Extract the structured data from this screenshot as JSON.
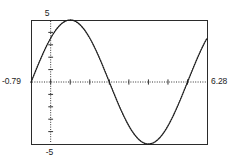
{
  "figure": {
    "name": "graphing-calculator-sine-plot",
    "background_color": "#ffffff",
    "ink_color": "#1c1c1c",
    "frame": {
      "left_px": 31,
      "top_px": 20,
      "right_px": 207,
      "bottom_px": 144,
      "border_color": "#2b2b2b",
      "border_width_px": 1
    }
  },
  "labels": {
    "y_max": "5",
    "y_min": "-5",
    "x_min": "-0.79",
    "x_max": "6.28"
  },
  "chart_data": {
    "type": "line",
    "title": "",
    "subtitle": "",
    "xlabel": "",
    "ylabel": "",
    "xlim": [
      -0.79,
      6.28
    ],
    "ylim": [
      -5,
      5
    ],
    "xtick_labels": [
      "-0.79",
      "6.28"
    ],
    "ytick_labels": [
      "5",
      "-5"
    ],
    "grid": false,
    "legend": null,
    "legend_position": "none",
    "axes_style": "dotted-with-ticks",
    "x_axis_y_value": 0,
    "y_axis_x_value": 0,
    "x_tick_interval": 0.7854,
    "y_tick_interval": 1,
    "annotations": [],
    "series": [
      {
        "name": "y = 5 sin(x + 0.79)",
        "amplitude": 5,
        "period": 6.2832,
        "phase_shift": 0.7854,
        "vertical_shift": 0,
        "line_style": "dotted",
        "line_color": "#1c1c1c",
        "x": [
          -0.79,
          -0.55,
          -0.31,
          -0.08,
          0.16,
          0.39,
          0.63,
          0.87,
          1.1,
          1.34,
          1.57,
          1.81,
          2.05,
          2.28,
          2.52,
          2.75,
          2.99,
          3.23,
          3.46,
          3.7,
          3.93,
          4.17,
          4.41,
          4.64,
          4.88,
          5.11,
          5.35,
          5.59,
          5.82,
          6.06,
          6.28
        ],
        "y": [
          0.0,
          1.18,
          2.29,
          3.24,
          4.0,
          4.52,
          4.88,
          4.98,
          4.8,
          4.33,
          3.62,
          2.69,
          1.58,
          0.39,
          -0.79,
          -1.95,
          -2.99,
          -3.85,
          -4.5,
          -4.89,
          -5.0,
          -4.83,
          -4.37,
          -3.67,
          -2.75,
          -1.68,
          -0.51,
          0.7,
          1.86,
          2.93,
          3.81
        ],
        "key_points": [
          {
            "label": "start",
            "x": -0.79,
            "y": 0
          },
          {
            "label": "first-peak",
            "x": 0.79,
            "y": 5
          },
          {
            "label": "first-zero-descending",
            "x": 2.36,
            "y": 0
          },
          {
            "label": "first-trough",
            "x": 3.93,
            "y": -5
          },
          {
            "label": "second-zero-ascending",
            "x": 5.5,
            "y": 0
          },
          {
            "label": "second-peak",
            "x": 7.07,
            "y": 5
          }
        ]
      }
    ]
  }
}
